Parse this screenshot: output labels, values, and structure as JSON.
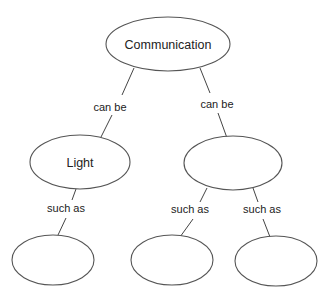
{
  "diagram": {
    "type": "concept-map",
    "nodes": [
      {
        "id": "n0",
        "label": "Communication",
        "cx": 168,
        "cy": 44,
        "rx": 62,
        "ry": 27
      },
      {
        "id": "n1",
        "label": "Light",
        "cx": 80,
        "cy": 162,
        "rx": 50,
        "ry": 27
      },
      {
        "id": "n2",
        "label": "",
        "cx": 233,
        "cy": 163,
        "rx": 49,
        "ry": 27
      },
      {
        "id": "n3",
        "label": "",
        "cx": 53,
        "cy": 260,
        "rx": 41,
        "ry": 25
      },
      {
        "id": "n4",
        "label": "",
        "cx": 172,
        "cy": 260,
        "rx": 41,
        "ry": 25
      },
      {
        "id": "n5",
        "label": "",
        "cx": 276,
        "cy": 261,
        "rx": 41,
        "ry": 25
      }
    ],
    "edges": [
      {
        "from": "n0",
        "to": "n1",
        "label": "can be"
      },
      {
        "from": "n0",
        "to": "n2",
        "label": "can be"
      },
      {
        "from": "n1",
        "to": "n3",
        "label": "such as"
      },
      {
        "from": "n2",
        "to": "n4",
        "label": "such as"
      },
      {
        "from": "n2",
        "to": "n5",
        "label": "such as"
      }
    ]
  }
}
